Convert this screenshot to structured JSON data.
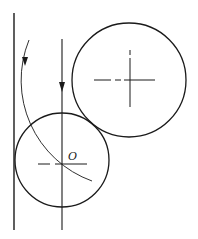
{
  "diagram": {
    "labels": {
      "small_circle_center": "O"
    },
    "colors": {
      "line": "#1a1a1a",
      "background": "#ffffff"
    },
    "elements": {
      "wall_line": {
        "x": 14,
        "y1": 13,
        "y2": 230
      },
      "vertical_axis": {
        "x": 62,
        "y1": 39,
        "y2": 230,
        "arrow": "down"
      },
      "small_circle": {
        "cx": 62,
        "cy": 160,
        "r": 47,
        "label": "O"
      },
      "large_circle": {
        "cx": 129,
        "cy": 80,
        "r": 57
      },
      "trajectory_arc": {
        "center": [
          129,
          80
        ],
        "r": 107,
        "arrow": "down"
      }
    }
  }
}
